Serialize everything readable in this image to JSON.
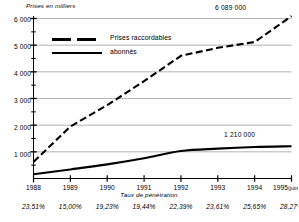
{
  "chart_data": {
    "type": "line",
    "title": "",
    "ylabel": "Prises en milliers",
    "xlabel": "Taux de pénétration",
    "ylim": [
      0,
      6000
    ],
    "ytick_labels": [
      "6 000",
      "5 000",
      "4 000",
      "3 000",
      "2 000",
      "1 000"
    ],
    "ytick_values": [
      6000,
      5000,
      4000,
      3000,
      2000,
      1000
    ],
    "minor_tick_values": [
      5500,
      4500,
      3500,
      2500,
      1500,
      500
    ],
    "grid": "horizontal",
    "categories": [
      "1988",
      "1989",
      "1990",
      "1991",
      "1992",
      "1993",
      "1994",
      "1995"
    ],
    "xtick_labels": [
      "1988",
      "1989",
      "1990",
      "1991",
      "1992",
      "1993",
      "1994",
      "1995"
    ],
    "last_xtick_suffix": "(juin)",
    "legend_position": "upper-left-inside",
    "series": [
      {
        "name": "Prises raccordables",
        "style": "dashed",
        "values": [
          620,
          1950,
          2750,
          3650,
          4600,
          4900,
          5120,
          6089
        ],
        "end_label": "6 089 000"
      },
      {
        "name": "abonnés",
        "style": "solid",
        "values": [
          160,
          340,
          530,
          760,
          1030,
          1120,
          1180,
          1210
        ],
        "end_label": "1 210 000"
      }
    ],
    "penetration_rates": [
      "23,51%",
      "15,00%",
      "19,23%",
      "19,44%",
      "22,39%",
      "23,61%",
      "25,65%",
      "28,27%"
    ],
    "annotations": [
      {
        "name": "top-end-label",
        "text": "6 089 000"
      },
      {
        "name": "bottom-end-label",
        "text": "1 210 000"
      }
    ],
    "colors": {
      "line": "#000000",
      "grid": "#9a9a9a",
      "axis": "#000000",
      "background": "#ffffff"
    }
  }
}
